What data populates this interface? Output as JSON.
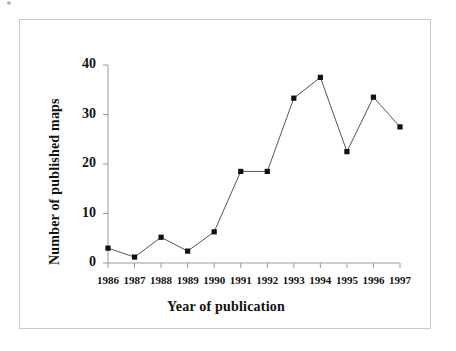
{
  "chart_data": {
    "type": "line",
    "title": "",
    "subtitle": "",
    "xlabel": "Year of publication",
    "ylabel": "Number of published maps",
    "categories": [
      "1986",
      "1987",
      "1988",
      "1989",
      "1990",
      "1991",
      "1992",
      "1993",
      "1994",
      "1995",
      "1996",
      "1997"
    ],
    "x": [
      1986,
      1987,
      1988,
      1989,
      1990,
      1991,
      1992,
      1993,
      1994,
      1995,
      1996,
      1997
    ],
    "values": [
      3.0,
      1.2,
      5.2,
      2.4,
      6.3,
      18.5,
      18.5,
      33.3,
      37.5,
      22.5,
      33.5,
      27.5
    ],
    "series": [
      {
        "name": "Published maps",
        "values": [
          3.0,
          1.2,
          5.2,
          2.4,
          6.3,
          18.5,
          18.5,
          33.3,
          37.5,
          22.5,
          33.5,
          27.5
        ]
      }
    ],
    "xlim": [
      1986,
      1997
    ],
    "ylim": [
      0,
      40
    ],
    "yticks": [
      0,
      10,
      20,
      30,
      40
    ],
    "ytick_labels": [
      "0",
      "10",
      "20",
      "30",
      "40"
    ],
    "xtick_labels": [
      "1986",
      "1987",
      "1988",
      "1989",
      "1990",
      "1991",
      "1992",
      "1993",
      "1994",
      "1995",
      "1996",
      "1997"
    ],
    "grid": false,
    "legend": false,
    "legend_position": "none",
    "marker": "square",
    "marker_color": "#111111",
    "line_color": "#555555",
    "axis_color": "#9a9a9a",
    "frame_color": "#c9c9c9",
    "background": "#ffffff"
  },
  "figure": {
    "border_color": "#c9c9c9"
  }
}
